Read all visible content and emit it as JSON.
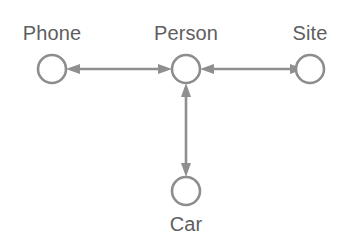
{
  "diagram": {
    "background_color": "#ffffff",
    "node_stroke_color": "#8d8d8d",
    "node_fill_color": "#ffffff",
    "edge_color": "#8f8f8f",
    "label_color": "#5e5e5e",
    "nodes": [
      {
        "id": "phone",
        "label": "Phone",
        "cx": 52,
        "cy": 69,
        "r": 14,
        "label_x": 52,
        "label_y": 22,
        "shape": "circle"
      },
      {
        "id": "person",
        "label": "Person",
        "cx": 186,
        "cy": 69,
        "r": 14,
        "label_x": 186,
        "label_y": 22,
        "shape": "circle"
      },
      {
        "id": "site",
        "label": "Site",
        "cx": 310,
        "cy": 69,
        "r": 14,
        "label_x": 310,
        "label_y": 22,
        "shape": "circle"
      },
      {
        "id": "car",
        "label": "Car",
        "cx": 186,
        "cy": 191,
        "r": 14,
        "label_x": 186,
        "label_y": 213,
        "shape": "circle"
      }
    ],
    "edges": [
      {
        "id": "phone-person",
        "from": "phone",
        "to": "person",
        "direction": "bidirectional",
        "orientation": "horizontal"
      },
      {
        "id": "site-person",
        "from": "site",
        "to": "person",
        "direction": "bidirectional",
        "orientation": "horizontal"
      },
      {
        "id": "car-person",
        "from": "car",
        "to": "person",
        "direction": "bidirectional",
        "orientation": "vertical"
      }
    ]
  }
}
